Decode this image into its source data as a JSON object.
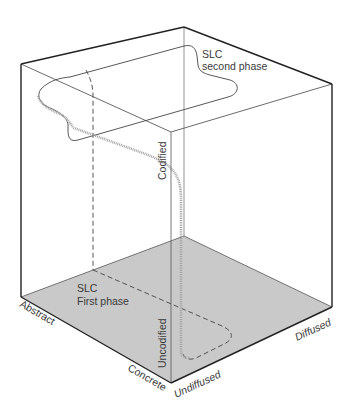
{
  "diagram": {
    "type": "3d-cube-information-space",
    "labels": {
      "second_phase_line1": "SLC",
      "second_phase_line2": "second phase",
      "first_phase_line1": "SLC",
      "first_phase_line2": "First phase"
    },
    "axes": {
      "codified": "Codified",
      "uncodified": "Uncodified",
      "abstract": "Abstract",
      "concrete": "Concrete",
      "undiffused": "Undiffused",
      "diffused": "Diffused"
    },
    "colors": {
      "floor": "#c8c8c8",
      "edge": "#333333",
      "thin_edge": "#555555",
      "curve": "#9a9a9a"
    }
  }
}
